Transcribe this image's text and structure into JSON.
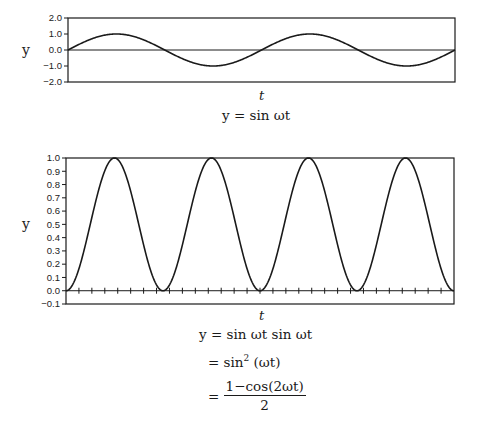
{
  "chart_data": [
    {
      "type": "line",
      "title": "",
      "xlabel": "t",
      "ylabel": "y",
      "caption": "y = sin ωt",
      "ylim": [
        -2.0,
        2.0
      ],
      "yticks": [
        "2.0",
        "1.0",
        "0.0",
        "−1.0",
        "−2.0"
      ],
      "ytick_values": [
        2.0,
        1.0,
        0.0,
        -1.0,
        -2.0
      ],
      "x_range_periods": 2,
      "function": "sin",
      "amplitude": 1.0,
      "series": [
        {
          "name": "y = sin ωt",
          "x_periods": [
            0,
            0.25,
            0.5,
            0.75,
            1.0,
            1.25,
            1.5,
            1.75,
            2.0
          ],
          "values": [
            0,
            1,
            0,
            -1,
            0,
            1,
            0,
            -1,
            0
          ]
        }
      ],
      "grid": false,
      "zero_line": true
    },
    {
      "type": "line",
      "title": "",
      "xlabel": "t",
      "ylabel": "y",
      "caption_lines": [
        "y = sin ωt sin ωt",
        "= sin²(ωt)",
        "= (1 − cos(2ωt)) / 2"
      ],
      "ylim": [
        -0.1,
        1.0
      ],
      "yticks": [
        "1.0",
        "0.9",
        "0.8",
        "0.7",
        "0.6",
        "0.5",
        "0.4",
        "0.3",
        "0.2",
        "0.1",
        "0.0",
        "−0.1"
      ],
      "ytick_values": [
        1.0,
        0.9,
        0.8,
        0.7,
        0.6,
        0.5,
        0.4,
        0.3,
        0.2,
        0.1,
        0.0,
        -0.1
      ],
      "x_range_periods": 2,
      "function": "sin^2",
      "series": [
        {
          "name": "y = sin²(ωt)",
          "x_periods": [
            0,
            0.25,
            0.5,
            0.75,
            1.0,
            1.25,
            1.5,
            1.75,
            2.0
          ],
          "values": [
            0,
            1,
            0,
            1,
            0,
            1,
            0,
            1,
            0
          ]
        }
      ],
      "x_minor_ticks": 30,
      "grid": false,
      "zero_line": true
    }
  ],
  "top_chart": {
    "ylabel": "y",
    "xlabel": "t",
    "yticks": [
      "2.0",
      "1.0",
      "0.0",
      "−1.0",
      "−2.0"
    ],
    "caption": "y = sin  ωt"
  },
  "bottom_chart": {
    "ylabel": "y",
    "xlabel": "t",
    "yticks": [
      "1.0",
      "0.9",
      "0.8",
      "0.7",
      "0.6",
      "0.5",
      "0.4",
      "0.3",
      "0.2",
      "0.1",
      "0.0",
      "−0.1"
    ],
    "formula_line1": "y = sin  ωt sin  ωt",
    "formula_line2_prefix": "= sin",
    "formula_line2_sup": "2",
    "formula_line2_suffix": "(ωt)",
    "formula_line3_prefix": "=",
    "formula_line3_num": "1−cos(2ωt)",
    "formula_line3_den": "2"
  },
  "colors": {
    "line": "#1a1a1a",
    "axis": "#1a1a1a",
    "background": "#ffffff"
  }
}
